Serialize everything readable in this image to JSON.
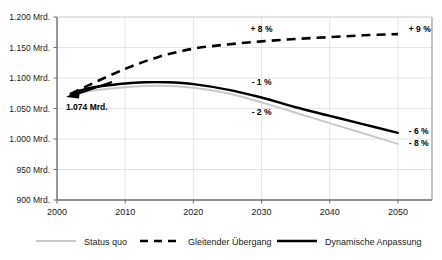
{
  "chart_data": {
    "type": "line",
    "title": "",
    "xlabel": "",
    "ylabel": "",
    "xlim": [
      2000,
      2055
    ],
    "ylim": [
      900,
      1200
    ],
    "grid": true,
    "legend_position": "bottom",
    "x_ticks": [
      "2000",
      "2010",
      "2020",
      "2030",
      "2040",
      "2050"
    ],
    "x_tick_values": [
      2000,
      2010,
      2020,
      2030,
      2040,
      2050
    ],
    "y_ticks": [
      "900 Mrd.",
      "950 Mrd.",
      "1.000 Mrd.",
      "1.050 Mrd.",
      "1.100 Mrd.",
      "1.150 Mrd.",
      "1.200 Mrd."
    ],
    "y_tick_values": [
      900,
      950,
      1000,
      1050,
      1100,
      1150,
      1200
    ],
    "unit_suffix": "Mrd.",
    "start_point": {
      "label": "1.074 Mrd.",
      "year": 2002,
      "value": 1074
    },
    "series": [
      {
        "name": "Status quo",
        "style": "solid",
        "color": "#c9c9c9",
        "width": 2.0,
        "x": [
          2002,
          2005,
          2010,
          2013,
          2016,
          2020,
          2025,
          2030,
          2035,
          2040,
          2045,
          2050
        ],
        "values": [
          1074,
          1079,
          1085,
          1087,
          1087,
          1084,
          1075,
          1060,
          1043,
          1026,
          1009,
          992
        ],
        "end_annotation": "- 8 %",
        "mid_annotation": "- 2 %"
      },
      {
        "name": "Gleitender Übergang",
        "style": "dashed",
        "color": "#000000",
        "width": 2.6,
        "x": [
          2002,
          2005,
          2010,
          2015,
          2020,
          2025,
          2030,
          2035,
          2040,
          2045,
          2050
        ],
        "values": [
          1074,
          1090,
          1115,
          1135,
          1148,
          1155,
          1160,
          1164,
          1167,
          1170,
          1172
        ],
        "end_annotation": "+ 9 %",
        "mid_annotation": "+ 8 %"
      },
      {
        "name": "Dynamische Anpassung",
        "style": "solid",
        "color": "#000000",
        "width": 2.4,
        "x": [
          2002,
          2005,
          2010,
          2013,
          2016,
          2020,
          2025,
          2030,
          2035,
          2040,
          2045,
          2050
        ],
        "values": [
          1074,
          1084,
          1091,
          1093,
          1093,
          1090,
          1081,
          1068,
          1052,
          1038,
          1024,
          1010
        ],
        "end_annotation": "- 6 %",
        "mid_annotation": "- 1 %"
      }
    ],
    "annotations": [
      {
        "text": "+ 8 %",
        "x": 2030,
        "y": 1180
      },
      {
        "text": "+ 9 %",
        "x": 2051,
        "y": 1180
      },
      {
        "text": "- 1 %",
        "x": 2030,
        "y": 1093
      },
      {
        "text": "- 2 %",
        "x": 2030,
        "y": 1045
      },
      {
        "text": "- 6 %",
        "x": 2051,
        "y": 1013
      },
      {
        "text": "- 8 %",
        "x": 2051,
        "y": 993
      }
    ]
  },
  "legend": {
    "items": [
      {
        "label": "Status quo",
        "color": "#c9c9c9",
        "style": "solid"
      },
      {
        "label": "Gleitender Übergang",
        "color": "#000000",
        "style": "dashed"
      },
      {
        "label": "Dynamische Anpassung",
        "color": "#000000",
        "style": "solid"
      }
    ]
  }
}
